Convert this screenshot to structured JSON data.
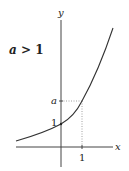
{
  "diagram": {
    "condition_label": "a > 1",
    "condition_var": "a",
    "condition_rest": " > 1",
    "x_axis_label": "x",
    "y_axis_label": "y",
    "y_tick_1": "1",
    "y_tick_a": "a",
    "x_tick_1": "1",
    "curve": "y = a^x",
    "colors": {
      "curve": "#333333",
      "axes": "#444444",
      "guides": "#888888"
    }
  }
}
